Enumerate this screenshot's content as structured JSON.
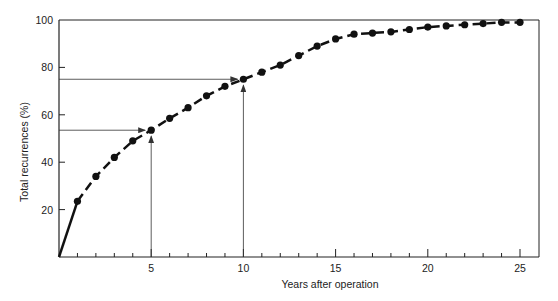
{
  "chart_data": {
    "type": "line",
    "title": "",
    "xlabel": "Years after operation",
    "ylabel": "Total recurrences (%)",
    "xlim": [
      0,
      25
    ],
    "ylim": [
      0,
      100
    ],
    "x_ticks": [
      5,
      10,
      15,
      20,
      25
    ],
    "y_ticks": [
      20,
      40,
      60,
      80,
      100
    ],
    "grid": false,
    "legend": null,
    "series": [
      {
        "name": "Total recurrences",
        "x": [
          0,
          1,
          2,
          3,
          4,
          5,
          6,
          7,
          8,
          9,
          10,
          11,
          12,
          13,
          14,
          15,
          16,
          17,
          18,
          19,
          20,
          21,
          22,
          23,
          24,
          25
        ],
        "values": [
          0,
          23.5,
          34,
          42,
          49,
          53.5,
          58.5,
          63,
          68,
          72,
          75,
          78,
          81,
          85,
          89,
          92,
          94,
          94.5,
          95,
          96,
          97,
          97.5,
          98,
          98.5,
          99,
          99
        ]
      }
    ],
    "annotations": [
      {
        "type": "arrow-guide",
        "x": 5,
        "y": 53.5,
        "description": "Horizontal and vertical arrows pointing to value at 5 years (~53%)"
      },
      {
        "type": "arrow-guide",
        "x": 10,
        "y": 75,
        "description": "Horizontal and vertical arrows pointing to value at 10 years (~75%)"
      }
    ]
  },
  "labels": {
    "xlabel": "Years after operation",
    "ylabel": "Total recurrences (%)",
    "x_ticks": [
      "5",
      "10",
      "15",
      "20",
      "25"
    ],
    "y_ticks": [
      "20",
      "40",
      "60",
      "80",
      "100"
    ]
  }
}
